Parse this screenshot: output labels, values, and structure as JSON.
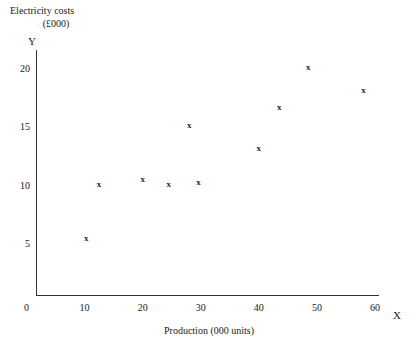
{
  "chart_data": {
    "type": "scatter",
    "title": "",
    "ylabel": "Electricity costs (£000)",
    "ylabel_line1": "Electricity costs",
    "ylabel_line2": "(£000)",
    "xlabel": "Production (000 units)",
    "y_axis_letter": "Y",
    "x_axis_letter": "X",
    "xlim": [
      0,
      60
    ],
    "ylim": [
      0,
      21
    ],
    "grid": false,
    "legend": null,
    "marker_glyph": "x",
    "xticks": [
      {
        "value": 0,
        "label": "0"
      },
      {
        "value": 10,
        "label": "10"
      },
      {
        "value": 20,
        "label": "20"
      },
      {
        "value": 30,
        "label": "30"
      },
      {
        "value": 40,
        "label": "40"
      },
      {
        "value": 50,
        "label": "50"
      },
      {
        "value": 60,
        "label": "60"
      }
    ],
    "yticks": [
      {
        "value": 5,
        "label": "5"
      },
      {
        "value": 10,
        "label": "10"
      },
      {
        "value": 15,
        "label": "15"
      },
      {
        "value": 20,
        "label": "20"
      }
    ],
    "points": [
      {
        "x": 10.3,
        "y": 5.3
      },
      {
        "x": 12.5,
        "y": 10.0
      },
      {
        "x": 20.0,
        "y": 10.4
      },
      {
        "x": 24.5,
        "y": 10.0
      },
      {
        "x": 28.0,
        "y": 15.0
      },
      {
        "x": 29.6,
        "y": 10.1
      },
      {
        "x": 40.0,
        "y": 13.0
      },
      {
        "x": 43.5,
        "y": 16.5
      },
      {
        "x": 48.5,
        "y": 20.0
      },
      {
        "x": 58.0,
        "y": 18.0
      }
    ]
  },
  "colors": {
    "axis": "#333333",
    "marker": "#222222",
    "text": "#1a1a1a",
    "background": "#ffffff"
  }
}
